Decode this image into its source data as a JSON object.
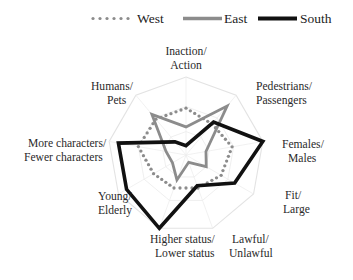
{
  "legend": {
    "position": "top",
    "items": [
      {
        "name": "West",
        "style": "dotted",
        "color": "#8c8c8c",
        "swatch": "dotted-line-swatch"
      },
      {
        "name": "East",
        "style": "solid",
        "color": "#8c8c8c",
        "swatch": "solid-gray-line-swatch"
      },
      {
        "name": "South",
        "style": "solid",
        "color": "#111111",
        "swatch": "solid-black-line-swatch"
      }
    ]
  },
  "chart_data": {
    "type": "radar",
    "title": "",
    "subtitle": "",
    "xlabel": "",
    "ylabel": "",
    "grid": true,
    "rings": 3,
    "rmin": 0,
    "rmax": 1,
    "legend_position": "top",
    "categories": [
      "Inaction/\nAction",
      "Pedestrians/\nPassengers",
      "Females/\nMales",
      "Fit/\nLarge",
      "Lawful/\nUnlawful",
      "Higher status/\nLower status",
      "Young/\nElderly",
      "More characters/\nFewer characters",
      "Humans/\nPets"
    ],
    "categories_flat": [
      "Inaction/Action",
      "Pedestrians/Passengers",
      "Females/Males",
      "Fit/Large",
      "Lawful/Unlawful",
      "Higher status/Lower status",
      "Young/Elderly",
      "More characters/Fewer characters",
      "Humans/Pets"
    ],
    "series": [
      {
        "name": "West",
        "style": "dotted",
        "color": "#8c8c8c",
        "values": [
          0.6,
          0.52,
          0.6,
          0.52,
          0.45,
          0.45,
          0.48,
          0.62,
          0.6
        ]
      },
      {
        "name": "East",
        "style": "solid",
        "color": "#8c8c8c",
        "values": [
          0.36,
          0.82,
          0.26,
          0.3,
          0.1,
          0.34,
          0.2,
          0.26,
          0.68
        ]
      },
      {
        "name": "South",
        "style": "solid",
        "color": "#111111",
        "values": [
          0.12,
          0.55,
          1.0,
          0.72,
          0.42,
          1.0,
          0.88,
          0.88,
          0.22
        ]
      }
    ]
  },
  "axis_label_lines": {
    "inaction_action": [
      "Inaction/",
      "Action"
    ],
    "pedestrians_passengers": [
      "Pedestrians/",
      "Passengers"
    ],
    "females_males": [
      "Females/",
      "Males"
    ],
    "fit_large": [
      "Fit/",
      "Large"
    ],
    "lawful_unlawful": [
      "Lawful/",
      "Unlawful"
    ],
    "higher_lower_status": [
      "Higher status/",
      "Lower status"
    ],
    "young_elderly": [
      "Young/",
      "Elderly"
    ],
    "more_fewer_characters": [
      "More characters/",
      "Fewer characters"
    ],
    "humans_pets": [
      "Humans/",
      "Pets"
    ]
  },
  "colors": {
    "grid": "#e3e3e3",
    "grid_inner": "#ededed",
    "west": "#8c8c8c",
    "east": "#8c8c8c",
    "south": "#111111",
    "text": "#2a2a2a",
    "background": "#ffffff"
  }
}
